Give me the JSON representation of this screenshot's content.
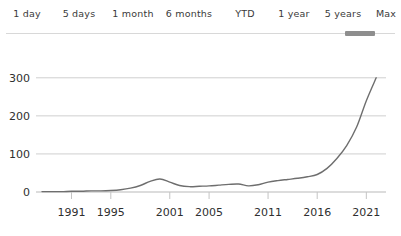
{
  "range_selector": {
    "tabs": [
      {
        "label": "1 day",
        "selected": false
      },
      {
        "label": "5 days",
        "selected": false
      },
      {
        "label": "1 month",
        "selected": false
      },
      {
        "label": "6 months",
        "selected": false
      },
      {
        "label": "YTD",
        "selected": false
      },
      {
        "label": "1 year",
        "selected": false
      },
      {
        "label": "5 years",
        "selected": false
      },
      {
        "label": "Max",
        "selected": true
      }
    ],
    "selected_label": "Max",
    "rule_color": "#d8d8d8",
    "indicator_color": "#8e8e8e"
  },
  "chart_data": {
    "type": "line",
    "title": "",
    "xlabel": "",
    "ylabel": "",
    "grid": true,
    "legend": "none",
    "line_color": "#6e6e6e",
    "grid_color": "#cfcfcf",
    "xlim": [
      1988,
      2023
    ],
    "ylim": [
      0,
      310
    ],
    "yticks": [
      0,
      100,
      200,
      300
    ],
    "ytick_labels": [
      "0",
      "100",
      "200",
      "300"
    ],
    "xticks": [
      1991,
      1995,
      2001,
      2005,
      2011,
      2016,
      2021
    ],
    "xtick_labels": [
      "1991",
      "1995",
      "2001",
      "2005",
      "2011",
      "2016",
      "2021"
    ],
    "series": [
      {
        "name": "value",
        "x": [
          1988,
          1989,
          1990,
          1991,
          1992,
          1993,
          1994,
          1995,
          1996,
          1997,
          1998,
          1999,
          2000,
          2001,
          2002,
          2003,
          2004,
          2005,
          2006,
          2007,
          2008,
          2009,
          2010,
          2011,
          2012,
          2013,
          2014,
          2015,
          2016,
          2017,
          2018,
          2019,
          2020,
          2021,
          2022
        ],
        "y": [
          1,
          1,
          1,
          2,
          2,
          3,
          3,
          4,
          6,
          10,
          17,
          28,
          34,
          26,
          17,
          14,
          15,
          16,
          18,
          20,
          21,
          16,
          19,
          26,
          30,
          33,
          36,
          40,
          46,
          62,
          88,
          122,
          170,
          240,
          300
        ]
      }
    ]
  }
}
